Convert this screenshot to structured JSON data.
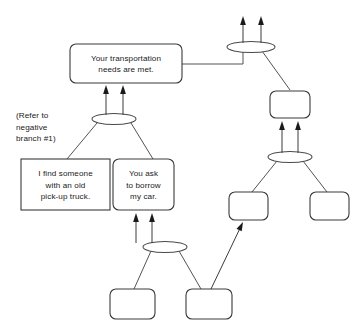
{
  "diagram": {
    "type": "future-reality-tree",
    "style": {
      "background": "#ffffff",
      "line_color": "#4a4a4a",
      "box_stroke": "#3a3a3a",
      "text_color": "#1a1a1a",
      "box_fill": "#ffffff"
    },
    "entities": [
      {
        "id": "goal",
        "shape": "rounded-rect",
        "lines": [
          "Your transportation",
          "needs are met."
        ],
        "x": 70,
        "y": 44,
        "w": 112,
        "h": 39,
        "rx": 6,
        "empty": false
      },
      {
        "id": "truck",
        "shape": "rect",
        "lines": [
          "I find someone",
          "with an old",
          "pick-up truck."
        ],
        "x": 21,
        "y": 159,
        "w": 89,
        "h": 51,
        "rx": 0,
        "empty": false
      },
      {
        "id": "borrow-car",
        "shape": "rounded-rect",
        "lines": [
          "You ask",
          "to borrow",
          "my car."
        ],
        "x": 113,
        "y": 159,
        "w": 61,
        "h": 51,
        "rx": 6,
        "empty": false
      },
      {
        "id": "blank-right-upper",
        "shape": "rounded-rect",
        "lines": [],
        "x": 270,
        "y": 91,
        "w": 40,
        "h": 27,
        "rx": 6,
        "empty": true
      },
      {
        "id": "blank-right-mid-left",
        "shape": "rounded-rect",
        "lines": [],
        "x": 229,
        "y": 192,
        "w": 39,
        "h": 28,
        "rx": 6,
        "empty": true
      },
      {
        "id": "blank-right-mid-right",
        "shape": "rounded-rect",
        "lines": [],
        "x": 310,
        "y": 192,
        "w": 39,
        "h": 28,
        "rx": 6,
        "empty": true
      },
      {
        "id": "blank-bottom-left",
        "shape": "rounded-rect",
        "lines": [],
        "x": 110,
        "y": 289,
        "w": 45,
        "h": 30,
        "rx": 6,
        "empty": true
      },
      {
        "id": "blank-bottom-right",
        "shape": "rounded-rect",
        "lines": [],
        "x": 186,
        "y": 289,
        "w": 46,
        "h": 30,
        "rx": 6,
        "empty": true
      }
    ],
    "connectors": [
      {
        "id": "and-goal",
        "cx": 114,
        "cy": 119,
        "rx": 22,
        "ry": 5.5
      },
      {
        "id": "and-top-right",
        "cx": 251,
        "cy": 47,
        "rx": 24,
        "ry": 5.5
      },
      {
        "id": "and-right-mid",
        "cx": 290,
        "cy": 157,
        "rx": 22,
        "ry": 5.5
      },
      {
        "id": "and-bottom",
        "cx": 165,
        "cy": 247,
        "rx": 22,
        "ry": 5.5
      }
    ],
    "annotation": {
      "id": "negative-branch-note",
      "lines": [
        "(Refer to",
        "negative",
        "branch #1)"
      ],
      "x": 16,
      "y": 118
    },
    "arrows": [
      {
        "id": "and-goal-to-goal-left",
        "x1": 106,
        "y1": 115,
        "x2": 106,
        "y2": 85
      },
      {
        "id": "and-goal-to-goal-right",
        "x1": 123,
        "y1": 115,
        "x2": 123,
        "y2": 85
      },
      {
        "id": "and-borrow-left",
        "x1": 136,
        "y1": 243,
        "x2": 136,
        "y2": 213
      },
      {
        "id": "and-borrow-right",
        "x1": 152,
        "y1": 243,
        "x2": 152,
        "y2": 213
      },
      {
        "id": "and-topright-up-left",
        "x1": 243,
        "y1": 43,
        "x2": 243,
        "y2": 16
      },
      {
        "id": "and-topright-up-right",
        "x1": 261,
        "y1": 43,
        "x2": 261,
        "y2": 16
      },
      {
        "id": "and-rightmid-up-left",
        "x1": 282,
        "y1": 153,
        "x2": 282,
        "y2": 121
      },
      {
        "id": "and-rightmid-up-right",
        "x1": 298,
        "y1": 153,
        "x2": 298,
        "y2": 121
      },
      {
        "id": "bottomright-to-midleft",
        "x1": 211,
        "y1": 289,
        "x2": 243,
        "y2": 222
      }
    ],
    "links": [
      {
        "id": "and-goal-to-truck",
        "points": "97,123 67,159"
      },
      {
        "id": "and-goal-to-borrow",
        "points": "131,123 153,159"
      },
      {
        "id": "goal-to-topright-and",
        "points": "182,64 243,64 243,50"
      },
      {
        "id": "topright-and-to-blank",
        "points": "262,51 290,90"
      },
      {
        "id": "rightmid-and-to-left",
        "points": "277,161 252,192"
      },
      {
        "id": "rightmid-and-to-right",
        "points": "303,161 327,192"
      },
      {
        "id": "and-bottom-to-left",
        "points": "151,251 134,289"
      },
      {
        "id": "and-bottom-to-right",
        "points": "179,251 201,289"
      }
    ]
  }
}
